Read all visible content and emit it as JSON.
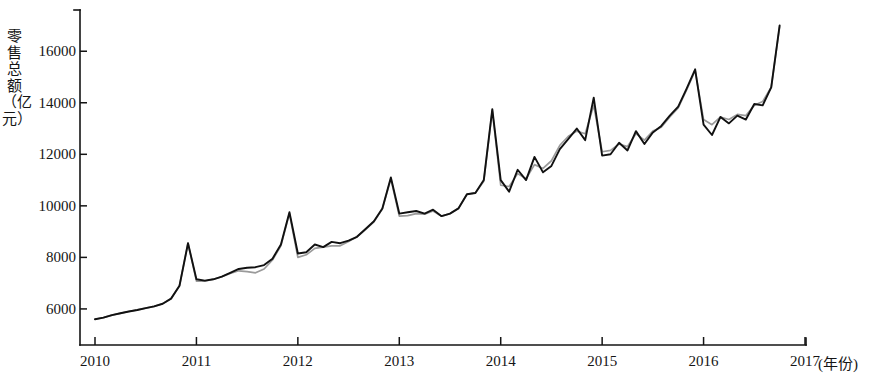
{
  "chart_data": {
    "type": "line",
    "title": "",
    "subtitle": "",
    "ylabel": "零售总额（亿元）",
    "xlabel": "(年份)",
    "xlabel_tick": "2017",
    "grid": false,
    "legend": "none",
    "xlim": [
      2010,
      2017
    ],
    "ylim": [
      4600,
      17600
    ],
    "yticks": [
      6000,
      8000,
      10000,
      12000,
      14000,
      16000
    ],
    "ytick_labels": [
      "6000",
      "8000",
      "10000",
      "12000",
      "14000",
      "16000"
    ],
    "xticks": [
      2010,
      2011,
      2012,
      2013,
      2014,
      2015,
      2016,
      2017
    ],
    "xtick_labels": [
      "2010",
      "2011",
      "2012",
      "2013",
      "2014",
      "2015",
      "2016",
      "2017"
    ],
    "x_unit": "年份",
    "y_unit": "亿元",
    "series": [
      {
        "name": "实际值",
        "color": "#111111",
        "x": [
          2010.0,
          2010.083,
          2010.167,
          2010.25,
          2010.333,
          2010.417,
          2010.5,
          2010.583,
          2010.667,
          2010.75,
          2010.833,
          2010.917,
          2011.0,
          2011.083,
          2011.167,
          2011.25,
          2011.333,
          2011.417,
          2011.5,
          2011.583,
          2011.667,
          2011.75,
          2011.833,
          2011.917,
          2012.0,
          2012.083,
          2012.167,
          2012.25,
          2012.333,
          2012.417,
          2012.5,
          2012.583,
          2012.667,
          2012.75,
          2012.833,
          2012.917,
          2013.0,
          2013.083,
          2013.167,
          2013.25,
          2013.333,
          2013.417,
          2013.5,
          2013.583,
          2013.667,
          2013.75,
          2013.833,
          2013.917,
          2014.0,
          2014.083,
          2014.167,
          2014.25,
          2014.333,
          2014.417,
          2014.5,
          2014.583,
          2014.667,
          2014.75,
          2014.833,
          2014.917,
          2015.0,
          2015.083,
          2015.167,
          2015.25,
          2015.333,
          2015.417,
          2015.5,
          2015.583,
          2015.667,
          2015.75,
          2015.833,
          2015.917,
          2016.0,
          2016.083,
          2016.167,
          2016.25,
          2016.333,
          2016.417,
          2016.5,
          2016.583,
          2016.667,
          2016.75
        ],
        "values": [
          5600,
          5660,
          5760,
          5830,
          5900,
          5960,
          6030,
          6100,
          6200,
          6400,
          6900,
          8550,
          7150,
          7100,
          7150,
          7250,
          7400,
          7550,
          7600,
          7620,
          7700,
          7950,
          8500,
          9750,
          8150,
          8200,
          8500,
          8400,
          8600,
          8550,
          8650,
          8800,
          9100,
          9400,
          9900,
          11100,
          9700,
          9750,
          9800,
          9700,
          9850,
          9600,
          9700,
          9900,
          10450,
          10500,
          11000,
          13750,
          11000,
          10550,
          11400,
          11000,
          11900,
          11300,
          11550,
          12200,
          12600,
          13000,
          12550,
          14200,
          11950,
          12000,
          12450,
          12150,
          12900,
          12400,
          12850,
          13100,
          13500,
          13850,
          14550,
          15300,
          13150,
          12750,
          13450,
          13200,
          13500,
          13350,
          13950,
          13900,
          14600,
          17000
        ]
      },
      {
        "name": "拟合值",
        "color": "#9a9a9a",
        "x": [
          2010.0,
          2010.083,
          2010.167,
          2010.25,
          2010.333,
          2010.417,
          2010.5,
          2010.583,
          2010.667,
          2010.75,
          2010.833,
          2010.917,
          2011.0,
          2011.083,
          2011.167,
          2011.25,
          2011.333,
          2011.417,
          2011.5,
          2011.583,
          2011.667,
          2011.75,
          2011.833,
          2011.917,
          2012.0,
          2012.083,
          2012.167,
          2012.25,
          2012.333,
          2012.417,
          2012.5,
          2012.583,
          2012.667,
          2012.75,
          2012.833,
          2012.917,
          2013.0,
          2013.083,
          2013.167,
          2013.25,
          2013.333,
          2013.417,
          2013.5,
          2013.583,
          2013.667,
          2013.75,
          2013.833,
          2013.917,
          2014.0,
          2014.083,
          2014.167,
          2014.25,
          2014.333,
          2014.417,
          2014.5,
          2014.583,
          2014.667,
          2014.75,
          2014.833,
          2014.917,
          2015.0,
          2015.083,
          2015.167,
          2015.25,
          2015.333,
          2015.417,
          2015.5,
          2015.583,
          2015.667,
          2015.75,
          2015.833,
          2015.917,
          2016.0,
          2016.083,
          2016.167,
          2016.25,
          2016.333,
          2016.417,
          2016.5,
          2016.583,
          2016.667,
          2016.75
        ],
        "values": [
          5600,
          5660,
          5760,
          5830,
          5900,
          5960,
          6030,
          6100,
          6200,
          6400,
          6900,
          8550,
          7080,
          7080,
          7150,
          7250,
          7380,
          7480,
          7450,
          7400,
          7550,
          7900,
          8450,
          9700,
          8000,
          8100,
          8350,
          8400,
          8450,
          8450,
          8620,
          8800,
          9080,
          9380,
          9880,
          11050,
          9600,
          9620,
          9700,
          9680,
          9800,
          9600,
          9700,
          9900,
          10450,
          10500,
          10950,
          13700,
          10800,
          10750,
          11250,
          11050,
          11600,
          11450,
          11750,
          12350,
          12700,
          12900,
          12800,
          13900,
          12100,
          12150,
          12400,
          12300,
          12800,
          12550,
          12900,
          13050,
          13450,
          13800,
          14500,
          15250,
          13350,
          13150,
          13450,
          13350,
          13550,
          13500,
          13900,
          14050,
          14600,
          16950
        ]
      }
    ]
  }
}
